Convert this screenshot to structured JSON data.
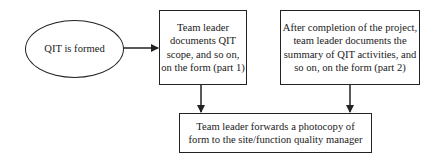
{
  "diagram": {
    "nodes": [
      {
        "id": "qit-formed",
        "shape": "ellipse",
        "label": "QIT is formed"
      },
      {
        "id": "part1",
        "shape": "rectangle",
        "label": "Team leader\ndocuments QIT\nscope, and so on,\non the form (part 1)"
      },
      {
        "id": "part2",
        "shape": "rectangle",
        "label": "After completion of the project,\nteam leader documents the\nsummary of QIT activities, and\nso on, on the form (part 2)"
      },
      {
        "id": "forward",
        "shape": "rectangle",
        "label": "Team leader forwards a photocopy of\nform to the site/function quality manager"
      }
    ],
    "edges": [
      {
        "from": "qit-formed",
        "to": "part1"
      },
      {
        "from": "part1",
        "to": "forward"
      },
      {
        "from": "part2",
        "to": "forward"
      }
    ],
    "colors": {
      "stroke": "#222222",
      "background": "#ffffff",
      "text": "#1a1a1a"
    }
  }
}
